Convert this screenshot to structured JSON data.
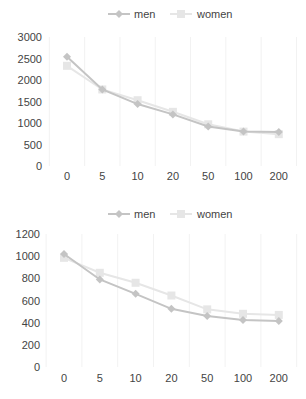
{
  "chart_data": [
    {
      "type": "line",
      "title": "",
      "xlabel": "",
      "ylabel": "",
      "categories": [
        "0",
        "5",
        "10",
        "20",
        "50",
        "100",
        "200"
      ],
      "ylim": [
        0,
        3000
      ],
      "yticks": [
        0,
        500,
        1000,
        1500,
        2000,
        2500,
        3000
      ],
      "grid": "vertical",
      "legend": "top-center",
      "series": [
        {
          "name": "men",
          "color": "#c4c4c4",
          "marker": "diamond",
          "values": [
            2540,
            1780,
            1440,
            1200,
            920,
            800,
            790
          ]
        },
        {
          "name": "women",
          "color": "#e6e6e6",
          "marker": "square",
          "values": [
            2330,
            1780,
            1530,
            1260,
            970,
            800,
            740
          ]
        }
      ]
    },
    {
      "type": "line",
      "title": "",
      "xlabel": "",
      "ylabel": "",
      "categories": [
        "0",
        "5",
        "10",
        "20",
        "50",
        "100",
        "200"
      ],
      "ylim": [
        0,
        1200
      ],
      "yticks": [
        0,
        200,
        400,
        600,
        800,
        1000,
        1200
      ],
      "grid": "vertical",
      "legend": "top-center",
      "series": [
        {
          "name": "men",
          "color": "#c4c4c4",
          "marker": "diamond",
          "values": [
            1020,
            790,
            660,
            525,
            460,
            425,
            415
          ]
        },
        {
          "name": "women",
          "color": "#e6e6e6",
          "marker": "square",
          "values": [
            985,
            850,
            760,
            645,
            520,
            480,
            470
          ]
        }
      ]
    }
  ]
}
